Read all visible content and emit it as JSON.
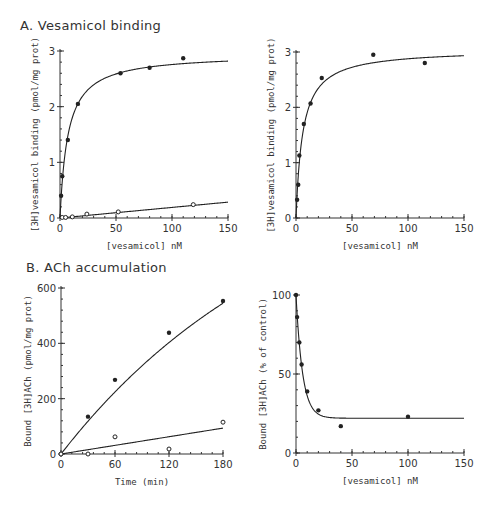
{
  "sections": {
    "A": {
      "title": "A. Vesamicol binding"
    },
    "B": {
      "title": "B. ACh accumulation"
    }
  },
  "chart_data": [
    {
      "id": "A-left",
      "type": "scatter",
      "title": "A. Vesamicol binding",
      "xlabel": "[vesamicol] nM",
      "ylabel": "[3H]vesamicol binding (pmol/mg prot)",
      "xlim": [
        0,
        150
      ],
      "ylim": [
        0,
        3
      ],
      "xticks": [
        0,
        50,
        100,
        150
      ],
      "yticks": [
        0,
        1,
        2,
        3
      ],
      "grid": false,
      "frame": {
        "x0": 60,
        "y0": 218,
        "x1": 228,
        "y1": 51
      },
      "series": [
        {
          "name": "total binding",
          "marker": "filled",
          "x": [
            1,
            2,
            7,
            16,
            54,
            80,
            110
          ],
          "y": [
            0.4,
            0.75,
            1.4,
            2.05,
            2.6,
            2.7,
            2.87
          ],
          "fit": {
            "model": "hyperbola",
            "Bmax": 2.95,
            "Kd": 7
          }
        },
        {
          "name": "nonspecific binding",
          "marker": "open",
          "x": [
            2,
            5,
            11,
            24,
            52,
            119
          ],
          "y": [
            0.01,
            0.01,
            0.02,
            0.07,
            0.11,
            0.24
          ],
          "fit": {
            "model": "linear",
            "slope": 0.0019,
            "intercept": 0
          }
        }
      ]
    },
    {
      "id": "A-right",
      "type": "scatter",
      "xlabel": "[vesamicol] nM",
      "ylabel": "[3H]vesamicol binding (pmol/mg prot)",
      "xlim": [
        0,
        150
      ],
      "ylim": [
        0,
        3
      ],
      "xticks": [
        0,
        50,
        100,
        150
      ],
      "yticks": [
        0,
        1,
        2,
        3
      ],
      "grid": false,
      "frame": {
        "x0": 296,
        "y0": 218,
        "x1": 464,
        "y1": 52
      },
      "series": [
        {
          "name": "specific binding",
          "marker": "filled",
          "x": [
            1,
            2,
            3,
            7,
            13,
            23,
            69,
            115
          ],
          "y": [
            0.33,
            0.6,
            1.13,
            1.7,
            2.07,
            2.53,
            2.95,
            2.8
          ],
          "fit": {
            "model": "hyperbola",
            "Bmax": 3.05,
            "Kd": 6
          }
        }
      ]
    },
    {
      "id": "B-left",
      "type": "scatter",
      "title": "B. ACh accumulation",
      "xlabel": "Time (min)",
      "ylabel": "Bound [3H]ACh (pmol/mg prot)",
      "xlim": [
        0,
        180
      ],
      "ylim": [
        0,
        600
      ],
      "xticks": [
        0,
        60,
        120,
        180
      ],
      "yticks": [
        0,
        200,
        400,
        600
      ],
      "grid": false,
      "frame": {
        "x0": 61,
        "y0": 454,
        "x1": 223,
        "y1": 288
      },
      "series": [
        {
          "name": "control",
          "marker": "filled",
          "x": [
            0,
            30,
            60,
            120,
            180
          ],
          "y": [
            0,
            135,
            268,
            438,
            553
          ],
          "fit": {
            "model": "exp_rise",
            "A": 1100,
            "k": 0.0038
          }
        },
        {
          "name": "with vesamicol",
          "marker": "open",
          "x": [
            0,
            30,
            60,
            120,
            180
          ],
          "y": [
            0,
            0,
            62,
            18,
            115
          ],
          "fit": {
            "model": "linear",
            "slope": 0.52,
            "intercept": 0
          }
        }
      ]
    },
    {
      "id": "B-right",
      "type": "scatter",
      "xlabel": "[vesamicol] nM",
      "ylabel": "Bound [3H]ACh (% of control)",
      "xlim": [
        0,
        150
      ],
      "ylim": [
        0,
        100
      ],
      "xticks": [
        0,
        50,
        100,
        150
      ],
      "yticks": [
        0,
        50,
        100
      ],
      "grid": false,
      "frame": {
        "x0": 296,
        "y0": 453,
        "x1": 464,
        "y1": 295
      },
      "series": [
        {
          "name": "inhibition",
          "marker": "filled",
          "x": [
            0,
            1,
            3,
            5,
            10,
            20,
            40,
            100
          ],
          "y": [
            100,
            86,
            70,
            56,
            39,
            27,
            17,
            23
          ],
          "fit": {
            "model": "exp_decay",
            "top": 100,
            "plateau": 22,
            "k": 0.17
          }
        }
      ]
    }
  ]
}
